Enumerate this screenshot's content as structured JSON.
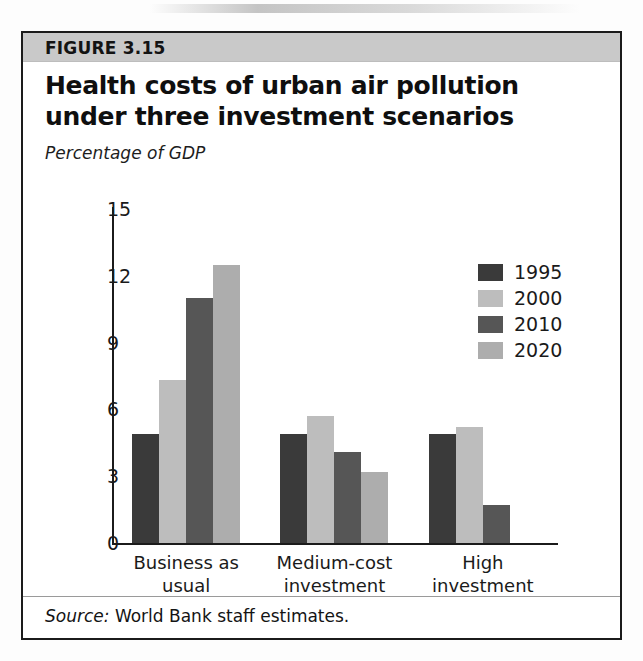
{
  "figure": {
    "label": "FIGURE 3.15",
    "title": "Health costs of urban air pollution under three investment scenarios",
    "subtitle": "Percentage of GDP",
    "source_prefix": "Source:",
    "source_text": "World Bank staff estimates."
  },
  "colors": {
    "band": "#c9c9c9",
    "border": "#1b1b1b",
    "series_1995": "#3a3a3a",
    "series_2000": "#bdbdbd",
    "series_2010": "#565656",
    "series_2020": "#adadad"
  },
  "chart_data": {
    "type": "bar",
    "title": "Health costs of urban air pollution under three investment scenarios",
    "subtitle": "Percentage of GDP",
    "xlabel": "",
    "ylabel": "Percentage of GDP",
    "ylim": [
      0,
      15
    ],
    "yticks": [
      0,
      3,
      6,
      9,
      12,
      15
    ],
    "ytick_labels": [
      "0",
      "3",
      "6",
      "9",
      "12",
      "15"
    ],
    "grid": false,
    "legend_position": "upper right",
    "categories": [
      "Business as usual",
      "Medium-cost investment",
      "High investment"
    ],
    "category_lines": [
      [
        "Business as usual"
      ],
      [
        "Medium-cost",
        "investment"
      ],
      [
        "High",
        "investment"
      ]
    ],
    "series": [
      {
        "name": "1995",
        "color": "#3a3a3a",
        "values": [
          4.9,
          4.9,
          4.9
        ]
      },
      {
        "name": "2000",
        "color": "#bdbdbd",
        "values": [
          7.3,
          5.7,
          5.2
        ]
      },
      {
        "name": "2010",
        "color": "#565656",
        "values": [
          11.0,
          4.1,
          1.7
        ]
      },
      {
        "name": "2020",
        "color": "#adadad",
        "values": [
          12.5,
          3.2,
          null
        ]
      }
    ]
  }
}
